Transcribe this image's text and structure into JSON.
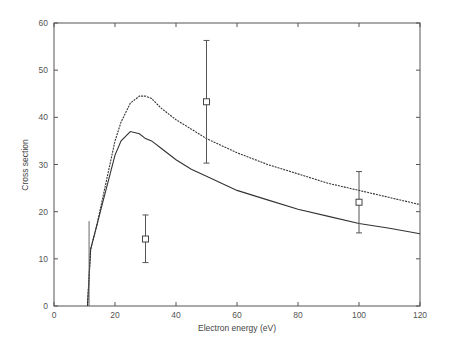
{
  "chart_data": {
    "type": "line",
    "title": "",
    "xlabel": "Electron energy (eV)",
    "ylabel": "Cross section",
    "xlim": [
      0,
      120
    ],
    "ylim": [
      0,
      60
    ],
    "xticks": [
      0,
      20,
      40,
      60,
      80,
      100,
      120
    ],
    "yticks": [
      0,
      10,
      20,
      30,
      40,
      50,
      60
    ],
    "grid": false,
    "legend": null,
    "series": [
      {
        "name": "upper curve (dashed)",
        "style": "dashed",
        "x": [
          11,
          12,
          14,
          16,
          18,
          20,
          22,
          25,
          28,
          30,
          32,
          35,
          40,
          45,
          50,
          60,
          70,
          80,
          90,
          100,
          110,
          120
        ],
        "y": [
          0,
          12,
          17,
          23,
          29,
          35,
          39,
          43,
          44.5,
          44.5,
          44,
          42,
          39.5,
          37.5,
          35.5,
          32.5,
          30,
          28,
          26,
          24.5,
          23,
          21.5
        ]
      },
      {
        "name": "lower curve (solid)",
        "style": "solid",
        "x": [
          11,
          12,
          14,
          16,
          18,
          20,
          22,
          25,
          28,
          30,
          32,
          35,
          40,
          45,
          50,
          60,
          70,
          80,
          90,
          100,
          110,
          120
        ],
        "y": [
          0,
          12,
          17,
          22,
          27,
          32,
          35,
          37,
          36.5,
          35.5,
          35,
          33.5,
          31,
          29,
          27.5,
          24.5,
          22.5,
          20.5,
          19,
          17.5,
          16.5,
          15.3
        ]
      }
    ],
    "points": {
      "name": "experimental data",
      "marker": "square",
      "x": [
        30,
        50,
        100
      ],
      "y": [
        14.2,
        43.3,
        22
      ],
      "yerr_low": [
        9.2,
        30.3,
        15.5
      ],
      "yerr_high": [
        19.3,
        56.3,
        28.5
      ]
    },
    "threshold_spike": {
      "x": 11.5,
      "y_top": 18
    }
  }
}
